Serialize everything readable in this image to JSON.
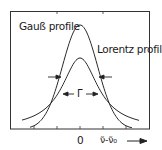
{
  "chart_data": {
    "type": "line",
    "title": "",
    "xlabel": "ν̃-ν̃₀",
    "ylabel": "",
    "x_ticks": [
      "0"
    ],
    "grid": false,
    "legend": "inline annotations",
    "series": [
      {
        "name": "Gauß profile",
        "peak_relative": 1.0,
        "shape": "gaussian"
      },
      {
        "name": "Lorentz profile",
        "peak_relative": 0.68,
        "shape": "lorentzian"
      }
    ],
    "annotations": [
      "Γ (full width at half maximum, both profiles equal)"
    ]
  },
  "labels": {
    "gauss": "Gauß profile",
    "lorentz": "Lorentz profile",
    "gamma": "Γ",
    "zero": "0",
    "xaxis": "ν̃-ν̃₀"
  },
  "colors": {
    "line": "#2a2a2a",
    "frame": "#333333",
    "background": "#ffffff"
  }
}
